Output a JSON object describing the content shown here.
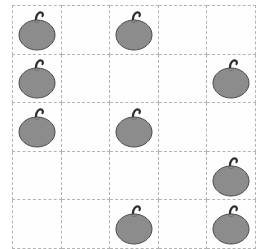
{
  "scene": {
    "title": "Fruit counting grid",
    "description": "A 5 by 5 dashed grid with gray apple shapes placed in some cells",
    "background_color": "#ffffff",
    "grid_line_color": "#b4b4b4",
    "grid_line_style": "dashed",
    "cell_background": "#fefefe"
  },
  "grid": {
    "rows": 5,
    "columns": 5,
    "cell_width": 47.6,
    "cell_height": 47.6,
    "origin_x": 12,
    "origin_y": 5,
    "total_width": 238,
    "total_height": 238
  },
  "item": {
    "name": "apple",
    "icon": "apple-icon",
    "body_color": "#8c8c8c",
    "body_outline_color": "#4a4a4a",
    "stem_color": "#2e2e2e",
    "body_width": 36,
    "body_height": 30,
    "count_total": 9
  },
  "occupancy": {
    "rows": [
      [
        1,
        0,
        1,
        0,
        0
      ],
      [
        1,
        0,
        0,
        0,
        1
      ],
      [
        1,
        0,
        1,
        0,
        0
      ],
      [
        0,
        0,
        0,
        0,
        1
      ],
      [
        0,
        0,
        1,
        0,
        1
      ]
    ],
    "filled_cells": [
      {
        "row": 1,
        "column": 1
      },
      {
        "row": 1,
        "column": 3
      },
      {
        "row": 2,
        "column": 1
      },
      {
        "row": 2,
        "column": 5
      },
      {
        "row": 3,
        "column": 1
      },
      {
        "row": 3,
        "column": 3
      },
      {
        "row": 4,
        "column": 5
      },
      {
        "row": 5,
        "column": 3
      },
      {
        "row": 5,
        "column": 5
      }
    ],
    "counts_per_row": [
      2,
      2,
      2,
      1,
      2
    ],
    "counts_per_column": [
      3,
      0,
      3,
      0,
      3
    ]
  }
}
